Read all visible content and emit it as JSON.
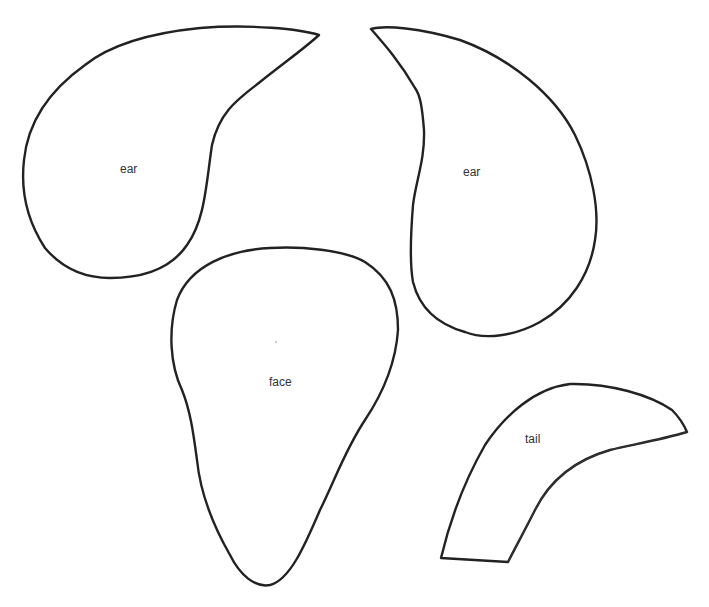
{
  "pieces": [
    {
      "id": "ear-left",
      "label": "ear"
    },
    {
      "id": "ear-right",
      "label": "ear"
    },
    {
      "id": "face",
      "label": "face"
    },
    {
      "id": "tail",
      "label": "tail"
    }
  ],
  "colors": {
    "background": "#ffffff",
    "outline": "#222222",
    "text": "#333333"
  }
}
